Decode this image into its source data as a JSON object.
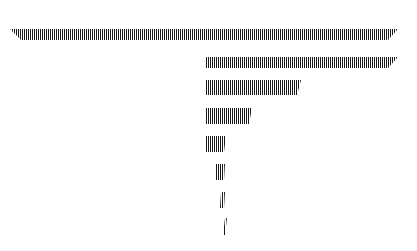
{
  "chart_data": {
    "type": "bar",
    "subtype": "funnel-like horizontal hatched bars (no labels)",
    "title": "",
    "xlabel": "",
    "ylabel": "",
    "categories": [
      "1",
      "2",
      "3",
      "4",
      "5",
      "6",
      "7",
      "8"
    ],
    "values": [
      388,
      193,
      96,
      47,
      21,
      9,
      4,
      2
    ],
    "bars": [
      {
        "y_top": 29,
        "y_bottom": 40,
        "x_top_left": 10,
        "x_bottom_left": 21,
        "x_top_right": 398,
        "x_bottom_right": 388
      },
      {
        "y_top": 57,
        "y_bottom": 68,
        "x_top_left": 205,
        "x_bottom_left": 205,
        "x_top_right": 398,
        "x_bottom_right": 388
      },
      {
        "y_top": 80,
        "y_bottom": 95,
        "x_top_left": 205,
        "x_bottom_left": 205,
        "x_top_right": 301,
        "x_bottom_right": 297
      },
      {
        "y_top": 108,
        "y_bottom": 124,
        "x_top_left": 205,
        "x_bottom_left": 205,
        "x_top_right": 252,
        "x_bottom_right": 249
      },
      {
        "y_top": 136,
        "y_bottom": 152,
        "x_top_left": 205,
        "x_bottom_left": 205,
        "x_top_right": 226,
        "x_bottom_right": 224
      },
      {
        "y_top": 164,
        "y_bottom": 180,
        "x_top_left": 216,
        "x_bottom_left": 216,
        "x_top_right": 225,
        "x_bottom_right": 224
      },
      {
        "y_top": 192,
        "y_bottom": 208,
        "x_top_left": 221,
        "x_bottom_left": 220,
        "x_top_right": 225,
        "x_bottom_right": 224
      },
      {
        "y_top": 218,
        "y_bottom": 235,
        "x_top_left": 225,
        "x_bottom_left": 223,
        "x_top_right": 227,
        "x_bottom_right": 225
      }
    ],
    "fill": "vertical hatching",
    "stripe_color": "#1a1a1a",
    "background": "#ffffff",
    "grid": false,
    "legend": null
  }
}
